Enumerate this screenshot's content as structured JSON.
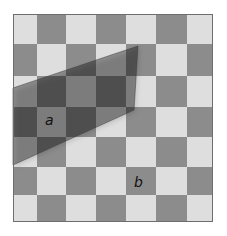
{
  "figure": {
    "background": "#ffffff",
    "board": {
      "x": 13,
      "y": 14,
      "width": 200,
      "height": 208,
      "border_color": "#6e6e6e",
      "columns": [
        13,
        37,
        66,
        96,
        126,
        156,
        187,
        213
      ],
      "rows": [
        14,
        44,
        76,
        107,
        137,
        167,
        195,
        222
      ],
      "first_square": "light",
      "light_color": "#dedede",
      "dark_color": "#8c8c8c"
    },
    "filter": {
      "points": [
        [
          13,
          88
        ],
        [
          138,
          46
        ],
        [
          134,
          110
        ],
        [
          13,
          165
        ]
      ],
      "color": "#000000",
      "opacity": 0.36,
      "edge_color": "#3a3a3a"
    },
    "labels": [
      {
        "text": "a",
        "x": 45,
        "y": 113
      },
      {
        "text": "b",
        "x": 134,
        "y": 175
      }
    ]
  }
}
